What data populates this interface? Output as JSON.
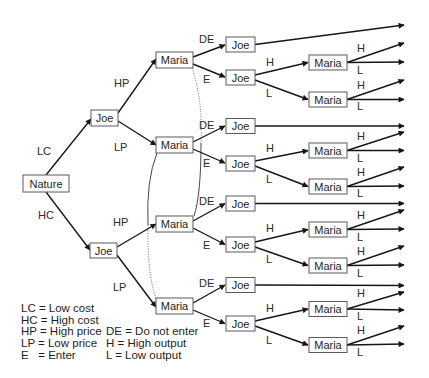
{
  "tree": {
    "root": {
      "player": "Nature"
    },
    "branches": [
      {
        "move": "LC",
        "player": "Joe",
        "branches": [
          {
            "move": "HP",
            "player": "Maria",
            "branches": [
              {
                "move": "DE",
                "player": "Joe"
              },
              {
                "move": "E",
                "player": "Joe",
                "branches": [
                  {
                    "move": "H",
                    "player": "Maria",
                    "outcomes": [
                      "H",
                      "L"
                    ]
                  },
                  {
                    "move": "L",
                    "player": "Maria",
                    "outcomes": [
                      "H",
                      "L"
                    ]
                  }
                ]
              }
            ]
          },
          {
            "move": "LP",
            "player": "Maria",
            "branches": [
              {
                "move": "DE",
                "player": "Joe"
              },
              {
                "move": "E",
                "player": "Joe",
                "branches": [
                  {
                    "move": "H",
                    "player": "Maria",
                    "outcomes": [
                      "H",
                      "L"
                    ]
                  },
                  {
                    "move": "L",
                    "player": "Maria",
                    "outcomes": [
                      "H",
                      "L"
                    ]
                  }
                ]
              }
            ]
          }
        ]
      },
      {
        "move": "HC",
        "player": "Joe",
        "branches": [
          {
            "move": "HP",
            "player": "Maria",
            "branches": [
              {
                "move": "DE",
                "player": "Joe"
              },
              {
                "move": "E",
                "player": "Joe",
                "branches": [
                  {
                    "move": "H",
                    "player": "Maria",
                    "outcomes": [
                      "H",
                      "L"
                    ]
                  },
                  {
                    "move": "L",
                    "player": "Maria",
                    "outcomes": [
                      "H",
                      "L"
                    ]
                  }
                ]
              }
            ]
          },
          {
            "move": "LP",
            "player": "Maria",
            "branches": [
              {
                "move": "DE",
                "player": "Joe"
              },
              {
                "move": "E",
                "player": "Joe",
                "branches": [
                  {
                    "move": "H",
                    "player": "Maria",
                    "outcomes": [
                      "H",
                      "L"
                    ]
                  },
                  {
                    "move": "L",
                    "player": "Maria",
                    "outcomes": [
                      "H",
                      "L"
                    ]
                  }
                ]
              }
            ]
          }
        ]
      }
    ]
  },
  "legend": {
    "left": [
      "LC = Low cost",
      "HC = High cost",
      "HP = High price",
      "LP = Low price",
      "E   = Enter"
    ],
    "right": [
      "DE = Do not enter",
      "H = High output",
      "L = Low output"
    ]
  },
  "colors": {
    "background": "#ffffff",
    "edge": "#161616",
    "box_border": "#5a5a5a",
    "text": "#1e1e1e"
  }
}
